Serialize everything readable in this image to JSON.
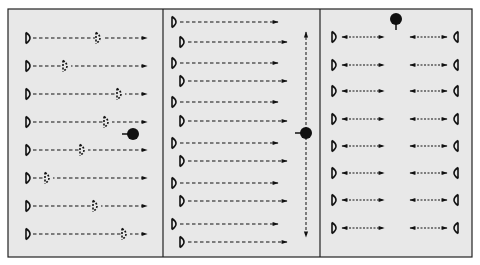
{
  "diagram": {
    "title": "",
    "colors": {
      "page_background": "#ffffff",
      "panel_background": "#e8e8e8",
      "border": "#222222",
      "ink": "#111111"
    },
    "frame": {
      "x": 8,
      "y": 9,
      "width": 464,
      "height": 248
    },
    "dividers_x": [
      163,
      320
    ],
    "panels": [
      {
        "id": "panel-1",
        "description": "Eight rows of solid D-shaped emitters with a dashed rightward arrow; a dashed 'ghost' D sits at varying positions along each line",
        "dot": {
          "x": 133,
          "y": 134,
          "stub": "left"
        },
        "rows": [
          {
            "y": 38,
            "emitter_x": 26,
            "line_end_x": 147,
            "ghost_x": 96
          },
          {
            "y": 66,
            "emitter_x": 26,
            "line_end_x": 147,
            "ghost_x": 63
          },
          {
            "y": 94,
            "emitter_x": 26,
            "line_end_x": 147,
            "ghost_x": 117
          },
          {
            "y": 122,
            "emitter_x": 26,
            "line_end_x": 147,
            "ghost_x": 104
          },
          {
            "y": 150,
            "emitter_x": 26,
            "line_end_x": 147,
            "ghost_x": 80
          },
          {
            "y": 178,
            "emitter_x": 26,
            "line_end_x": 147,
            "ghost_x": 45
          },
          {
            "y": 206,
            "emitter_x": 26,
            "line_end_x": 147,
            "ghost_x": 93
          },
          {
            "y": 234,
            "emitter_x": 26,
            "line_end_x": 147,
            "ghost_x": 122
          }
        ]
      },
      {
        "id": "panel-2",
        "description": "Twelve staggered D-shaped emitters in pairs with dashed rightward arrows; a vertical dashed double-headed arrow with a dot",
        "dot": {
          "x": 306,
          "y": 133,
          "stub": "left"
        },
        "vertical_arrow": {
          "x": 306,
          "y1": 32,
          "y2": 237
        },
        "rows": [
          {
            "y": 22,
            "emitter_x": 172,
            "line_end_x": 278
          },
          {
            "y": 42,
            "emitter_x": 180,
            "line_end_x": 287
          },
          {
            "y": 63,
            "emitter_x": 172,
            "line_end_x": 278
          },
          {
            "y": 81,
            "emitter_x": 180,
            "line_end_x": 287
          },
          {
            "y": 102,
            "emitter_x": 172,
            "line_end_x": 278
          },
          {
            "y": 121,
            "emitter_x": 180,
            "line_end_x": 287
          },
          {
            "y": 143,
            "emitter_x": 172,
            "line_end_x": 278
          },
          {
            "y": 161,
            "emitter_x": 180,
            "line_end_x": 287
          },
          {
            "y": 183,
            "emitter_x": 172,
            "line_end_x": 278
          },
          {
            "y": 201,
            "emitter_x": 180,
            "line_end_x": 287
          },
          {
            "y": 224,
            "emitter_x": 172,
            "line_end_x": 278
          },
          {
            "y": 242,
            "emitter_x": 180,
            "line_end_x": 287
          }
        ]
      },
      {
        "id": "panel-3",
        "description": "Eight rows with facing D emitters on each side and short dashed double-headed arrows; a dot at top center with stub pointing down",
        "dot": {
          "x": 396,
          "y": 19,
          "stub": "down"
        },
        "left_emitter_x": 332,
        "right_emitter_x": 458,
        "left_arrow": {
          "x1": 342,
          "x2": 384
        },
        "right_arrow": {
          "x1": 410,
          "x2": 447
        },
        "rows_y": [
          37,
          65,
          91,
          119,
          146,
          173,
          200,
          228
        ]
      }
    ]
  }
}
